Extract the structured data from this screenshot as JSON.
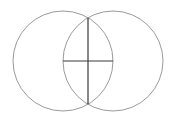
{
  "diagram": {
    "type": "geometric-construction",
    "units": {
      "radius": 1,
      "center_distance": 1
    },
    "circles": [
      {
        "name": "left-circle",
        "center": [
          0,
          0
        ],
        "radius": 1,
        "stroke": "#9a9a9a"
      },
      {
        "name": "right-circle",
        "center": [
          1,
          0
        ],
        "radius": 1,
        "stroke": "#9a9a9a"
      }
    ],
    "segments": [
      {
        "name": "common-chord",
        "relation": "joins intersection points of the circles",
        "orientation": "vertical",
        "stroke": "#3a3a3a"
      },
      {
        "name": "line-of-centers",
        "relation": "joins centers of the circles",
        "orientation": "horizontal",
        "stroke": "#3a3a3a"
      }
    ],
    "labels": []
  }
}
